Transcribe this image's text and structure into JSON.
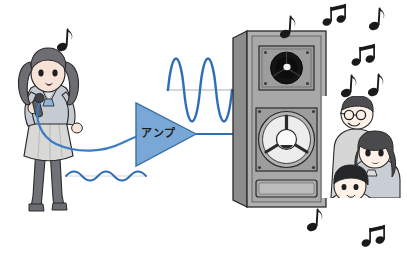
{
  "illustration": {
    "title": "Audio amplification illustration",
    "subject": "singer into microphone, weak signal amplified by amplifier, loud sound from speaker heard by listeners",
    "background_color": "#ffffff"
  },
  "colors": {
    "wave_blue": "#2f6db4",
    "amp_fill": "#79a8d6",
    "amp_stroke": "#3a6fa8",
    "cable_blue": "#3b7cc0",
    "speaker_body": "#b0b0b0",
    "speaker_side": "#8c8c8c",
    "speaker_baffle": "#a3a3a3",
    "driver_black": "#141414",
    "outline": "#2a2a2a",
    "note_black": "#1a1a1a",
    "skin": "#f6e2d6",
    "uniform_gray": "#c9cdd4",
    "hair_gray": "#6e6e72"
  },
  "singer": {
    "name": "singer-girl",
    "description": "girl in school uniform singing into a microphone",
    "holds": "microphone",
    "cable_color": "#3b7cc0"
  },
  "amplifier": {
    "name": "amplifier",
    "label": "アンプ",
    "shape": "triangle",
    "fill": "#79a8d6"
  },
  "signals": {
    "input": {
      "name": "weak-input-waveform",
      "label": "small amplitude wave",
      "amplitude": "small",
      "cycles": 5,
      "color": "#2f6db4"
    },
    "output": {
      "name": "amplified-output-waveform",
      "label": "large amplitude wave",
      "amplitude": "large",
      "cycles": 3,
      "color": "#2f6db4"
    }
  },
  "speaker": {
    "name": "loudspeaker-cabinet",
    "parts": [
      {
        "name": "tweeter",
        "label": "tweeter driver"
      },
      {
        "name": "woofer",
        "label": "woofer driver"
      },
      {
        "name": "bass-port",
        "label": "bass reflex port"
      }
    ]
  },
  "listeners": [
    {
      "name": "listener-man-with-glasses",
      "label": "man with glasses"
    },
    {
      "name": "listener-girl",
      "label": "girl with long hair and ribbon"
    },
    {
      "name": "listener-boy",
      "label": "boy resting on hand"
    }
  ],
  "music_notes": [
    {
      "name": "note-singer",
      "glyph": "eighth"
    },
    {
      "name": "note-top-1",
      "glyph": "eighth"
    },
    {
      "name": "note-top-2",
      "glyph": "beamed"
    },
    {
      "name": "note-top-3",
      "glyph": "eighth"
    },
    {
      "name": "note-right-1",
      "glyph": "beamed"
    },
    {
      "name": "note-right-2",
      "glyph": "eighth"
    },
    {
      "name": "note-right-3",
      "glyph": "eighth"
    },
    {
      "name": "note-bottom-1",
      "glyph": "eighth"
    },
    {
      "name": "note-bottom-2",
      "glyph": "beamed"
    }
  ]
}
